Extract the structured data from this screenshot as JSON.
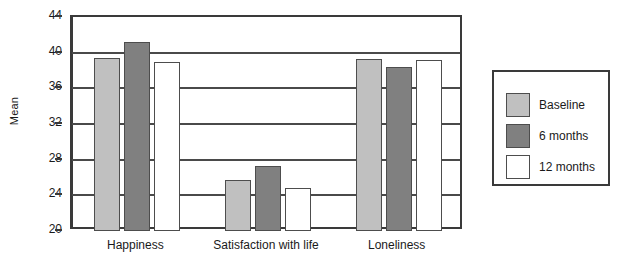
{
  "chart_data": {
    "type": "bar",
    "title": "",
    "xlabel": "",
    "ylabel": "Mean",
    "ylim": [
      20,
      44
    ],
    "yticks": [
      20,
      24,
      28,
      32,
      36,
      40,
      44
    ],
    "grid": true,
    "legend_position": "right",
    "categories": [
      "Happiness",
      "Satisfaction with life",
      "Loneliness"
    ],
    "series": [
      {
        "name": "Baseline",
        "color": "#c0c0c0",
        "values": [
          39.4,
          25.7,
          39.3
        ]
      },
      {
        "name": "6 months",
        "color": "#808080",
        "values": [
          41.2,
          27.3,
          38.4
        ]
      },
      {
        "name": "12 months",
        "color": "#ffffff",
        "values": [
          39.0,
          24.8,
          39.2
        ]
      }
    ]
  },
  "legend": {
    "items": [
      {
        "label": "Baseline",
        "color": "#c0c0c0"
      },
      {
        "label": "6 months",
        "color": "#808080"
      },
      {
        "label": "12 months",
        "color": "#ffffff"
      }
    ]
  },
  "axis": {
    "y_title": "Mean",
    "y_tick_labels": [
      "44",
      "40",
      "36",
      "32",
      "28",
      "24",
      "20"
    ],
    "x_tick_labels": [
      "Happiness",
      "Satisfaction with life",
      "Loneliness"
    ]
  }
}
